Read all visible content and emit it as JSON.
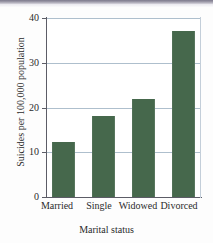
{
  "chart_data": {
    "type": "bar",
    "title": "",
    "categories": [
      "Married",
      "Single",
      "Widowed",
      "Divorced"
    ],
    "values": [
      12.4,
      18.0,
      22.0,
      37.0
    ],
    "xlabel": "Marital status",
    "ylabel": "Suicides per 100,000 population",
    "ylim": [
      0,
      40
    ],
    "yticks": [
      0,
      10,
      20,
      30,
      40
    ],
    "ytick_labels": [
      "0",
      "10",
      "20",
      "30",
      "40"
    ],
    "grid": true,
    "grid_axis": "y",
    "legend": false,
    "bar_color": "#46684c",
    "grid_color": "#aebfcd",
    "axis_color": "#5c5c66",
    "background_color": "#ffffff"
  },
  "ticks": {
    "t0": "0",
    "t10": "10",
    "t20": "20",
    "t30": "30",
    "t40": "40"
  },
  "cats": {
    "c0": "Married",
    "c1": "Single",
    "c2": "Widowed",
    "c3": "Divorced"
  },
  "labels": {
    "x_axis_title": "Marital status",
    "y_axis_title": "Suicides per 100,000 population"
  }
}
